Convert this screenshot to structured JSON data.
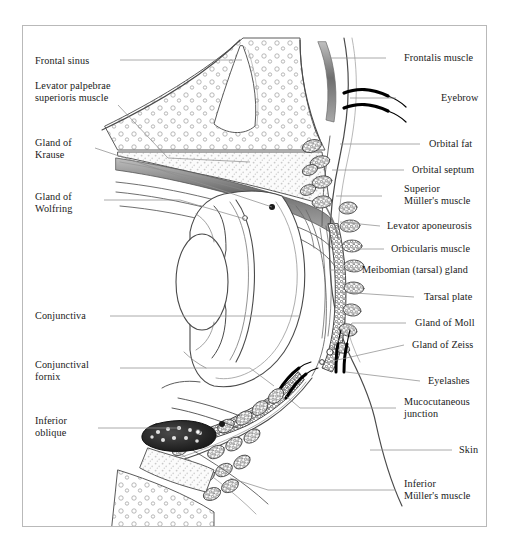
{
  "figure": {
    "border_color": "#b9b9b9",
    "background": "#ffffff",
    "ink_color": "#3a3a3a",
    "leader_color": "#8f8f8f"
  },
  "labels_left": [
    {
      "id": "frontal-sinus",
      "text": "Frontal sinus",
      "x": 35,
      "y": 60
    },
    {
      "id": "levator-palpebrae",
      "text": "Levator palpebrae\nsuperioris muscle",
      "x": 35,
      "y": 86
    },
    {
      "id": "gland-of-krause",
      "text": "Gland of\nKrause",
      "x": 35,
      "y": 142
    },
    {
      "id": "gland-of-wolfring",
      "text": "Gland of\nWolfring",
      "x": 35,
      "y": 196
    },
    {
      "id": "conjunctiva",
      "text": "Conjunctiva",
      "x": 35,
      "y": 312
    },
    {
      "id": "conjunctival-fornix",
      "text": "Conjunctival\nfornix",
      "x": 35,
      "y": 364
    },
    {
      "id": "inferior-oblique",
      "text": "Inferior\noblique",
      "x": 35,
      "y": 420
    }
  ],
  "labels_right": [
    {
      "id": "frontalis-muscle",
      "text": "Frontalis muscle",
      "x": 404,
      "y": 54
    },
    {
      "id": "eyebrow",
      "text": "Eyebrow",
      "x": 441,
      "y": 94
    },
    {
      "id": "orbital-fat",
      "text": "Orbital fat",
      "x": 429,
      "y": 140
    },
    {
      "id": "orbital-septum",
      "text": "Orbital septum",
      "x": 412,
      "y": 166
    },
    {
      "id": "superior-mullers-muscle",
      "text": "Superior\nMüller's muscle",
      "x": 404,
      "y": 185
    },
    {
      "id": "levator-aponeurosis",
      "text": "Levator aponeurosis",
      "x": 387,
      "y": 222
    },
    {
      "id": "orbicularis-muscle",
      "text": "Orbicularis muscle",
      "x": 391,
      "y": 245
    },
    {
      "id": "meibomian-tarsal-gland",
      "text": "Meibomian (tarsal) gland",
      "x": 364,
      "y": 266
    },
    {
      "id": "tarsal-plate",
      "text": "Tarsal plate",
      "x": 424,
      "y": 293
    },
    {
      "id": "gland-of-moll",
      "text": "Gland of Moll",
      "x": 415,
      "y": 319
    },
    {
      "id": "gland-of-zeiss",
      "text": "Gland of Zeiss",
      "x": 412,
      "y": 341
    },
    {
      "id": "eyelashes",
      "text": "Eyelashes",
      "x": 428,
      "y": 377
    },
    {
      "id": "mucocutaneous-junction",
      "text": "Mucocutaneous\njunction",
      "x": 404,
      "y": 398
    },
    {
      "id": "skin",
      "text": "Skin",
      "x": 459,
      "y": 446
    },
    {
      "id": "inferior-mullers-muscle",
      "text": "Inferior\nMüller's muscle",
      "x": 404,
      "y": 480
    }
  ],
  "structures": [
    {
      "id": "frontal-sinus-cavity",
      "name": "frontal sinus cavity"
    },
    {
      "id": "frontal-bone",
      "name": "frontal bone with marrow spaces"
    },
    {
      "id": "superior-orbital-fat",
      "name": "superior orbital fat pad"
    },
    {
      "id": "levator-muscle-belly",
      "name": "levator palpebrae superioris muscle belly"
    },
    {
      "id": "globe",
      "name": "globe of the eye"
    },
    {
      "id": "lens",
      "name": "crystalline lens"
    },
    {
      "id": "cornea",
      "name": "cornea"
    },
    {
      "id": "iris",
      "name": "iris"
    },
    {
      "id": "upper-tarsal-plate",
      "name": "upper tarsal plate"
    },
    {
      "id": "lower-tarsal-plate",
      "name": "lower tarsal plate"
    },
    {
      "id": "meibomian-glands",
      "name": "meibomian gland acini"
    },
    {
      "id": "orbicularis-bundles",
      "name": "orbicularis oculi muscle bundles"
    },
    {
      "id": "eyebrow-hairs",
      "name": "eyebrow hairs"
    },
    {
      "id": "eyelash-hairs",
      "name": "eyelash hairs"
    },
    {
      "id": "inferior-oblique-muscle",
      "name": "inferior oblique muscle in cross-section"
    },
    {
      "id": "inferior-orbital-fat",
      "name": "inferior orbital fat pad"
    }
  ]
}
